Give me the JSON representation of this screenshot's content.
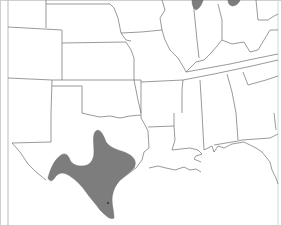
{
  "map": {
    "type": "range-map",
    "region": "South-central and eastern United States",
    "colors": {
      "background": "#ffffff",
      "border": "#6f6f6f",
      "range_fill": "#7d7d7d"
    },
    "shaded_regions": [
      {
        "name": "texas-range",
        "description": "Central and south Texas range"
      },
      {
        "name": "indiana-patch",
        "description": "Northwest Indiana patch"
      },
      {
        "name": "ohio-patch",
        "description": "Northwest Ohio patch"
      }
    ]
  }
}
